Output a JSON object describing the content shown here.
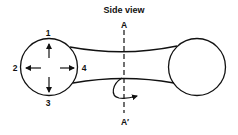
{
  "title": "Side view",
  "section_line": {
    "top_label": "A",
    "bottom_label": "A′"
  },
  "left_circle": {
    "arrows": [
      {
        "label": "1",
        "direction": "up"
      },
      {
        "label": "2",
        "direction": "left"
      },
      {
        "label": "3",
        "direction": "down"
      },
      {
        "label": "4",
        "direction": "right"
      }
    ]
  },
  "icons": [
    "arrow-up-icon",
    "arrow-left-icon",
    "arrow-down-icon",
    "arrow-right-icon",
    "curved-rotation-arrow-icon"
  ],
  "colors": {
    "stroke": "#111111",
    "background": "#ffffff"
  }
}
